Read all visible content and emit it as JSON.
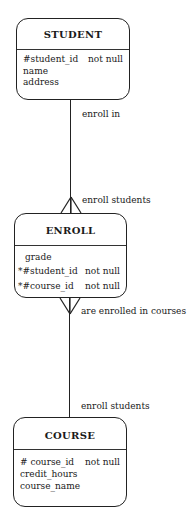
{
  "diagram": {
    "entities": [
      {
        "name": "STUDENT",
        "attributes": [
          {
            "name": "#student_id",
            "constraint": "not null"
          },
          {
            "name": "name",
            "constraint": ""
          },
          {
            "name": "address",
            "constraint": ""
          }
        ]
      },
      {
        "name": "ENROLL",
        "attributes": [
          {
            "name": "grade",
            "constraint": ""
          },
          {
            "name": "*#student_id",
            "constraint": "not null"
          },
          {
            "name": "*#course_id",
            "constraint": "not null"
          }
        ]
      },
      {
        "name": "COURSE",
        "attributes": [
          {
            "name": "# course_id",
            "constraint": "not null"
          },
          {
            "name": "credit_hours",
            "constraint": ""
          },
          {
            "name": "course_name",
            "constraint": ""
          }
        ]
      }
    ],
    "relationships": [
      {
        "from": "STUDENT",
        "to": "ENROLL",
        "label_top": "enroll in",
        "label_bottom": "enroll students"
      },
      {
        "from": "ENROLL",
        "to": "COURSE",
        "label_top": "are enrolled in courses",
        "label_bottom": "enroll students"
      }
    ]
  }
}
